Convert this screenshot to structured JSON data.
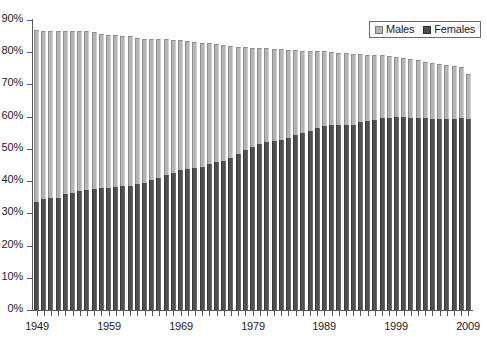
{
  "chart_data": {
    "type": "bar",
    "subtype": "stacked-bar",
    "title": "",
    "subtitle": "",
    "xlabel": "",
    "ylabel": "",
    "ylim": [
      0,
      90
    ],
    "ytick_labels": [
      "0%",
      "10%",
      "20%",
      "30%",
      "40%",
      "50%",
      "60%",
      "70%",
      "80%",
      "90%"
    ],
    "ytick_values": [
      0,
      10,
      20,
      30,
      40,
      50,
      60,
      70,
      80,
      90
    ],
    "xtick_labels": [
      "1949",
      "1959",
      "1969",
      "1979",
      "1989",
      "1999",
      "2009"
    ],
    "xtick_values": [
      1949,
      1959,
      1969,
      1979,
      1989,
      1999,
      2009
    ],
    "grid": false,
    "legend_position": "top-right",
    "legend": [
      "Males",
      "Females"
    ],
    "categories": [
      1949,
      1950,
      1951,
      1952,
      1953,
      1954,
      1955,
      1956,
      1957,
      1958,
      1959,
      1960,
      1961,
      1962,
      1963,
      1964,
      1965,
      1966,
      1967,
      1968,
      1969,
      1970,
      1971,
      1972,
      1973,
      1974,
      1975,
      1976,
      1977,
      1978,
      1979,
      1980,
      1981,
      1982,
      1983,
      1984,
      1985,
      1986,
      1987,
      1988,
      1989,
      1990,
      1991,
      1992,
      1993,
      1994,
      1995,
      1996,
      1997,
      1998,
      1999,
      2000,
      2001,
      2002,
      2003,
      2004,
      2005,
      2006,
      2007,
      2008,
      2009
    ],
    "series": [
      {
        "name": "Females",
        "color": "#4f4f51",
        "values": [
          33.4,
          34.5,
          34.8,
          34.7,
          36.0,
          36.4,
          36.9,
          37.3,
          37.5,
          37.8,
          38.0,
          38.3,
          38.5,
          38.6,
          39.0,
          39.4,
          40.3,
          41.1,
          41.9,
          42.6,
          43.5,
          43.9,
          44.0,
          44.4,
          45.3,
          46.0,
          46.4,
          47.3,
          48.3,
          49.8,
          50.7,
          51.4,
          52.0,
          52.3,
          52.7,
          53.3,
          54.2,
          54.8,
          55.6,
          56.4,
          57.2,
          57.4,
          57.3,
          57.5,
          57.5,
          58.4,
          58.8,
          59.1,
          59.5,
          59.5,
          59.8,
          59.9,
          59.7,
          59.6,
          59.5,
          59.2,
          59.3,
          59.4,
          59.3,
          59.5,
          59.2
        ]
      },
      {
        "name": "Males",
        "color": "#b5b5b5",
        "values": [
          53.5,
          52.2,
          51.8,
          52.0,
          50.7,
          50.2,
          49.7,
          49.3,
          48.9,
          48.0,
          47.5,
          47.1,
          46.6,
          46.3,
          45.5,
          44.8,
          43.7,
          42.9,
          42.1,
          41.3,
          40.2,
          39.6,
          39.2,
          38.5,
          37.6,
          36.6,
          35.7,
          34.6,
          33.4,
          31.9,
          30.7,
          29.9,
          29.3,
          28.8,
          28.2,
          27.4,
          26.4,
          25.7,
          24.9,
          24.0,
          23.1,
          22.8,
          22.6,
          22.2,
          21.9,
          21.0,
          20.5,
          20.0,
          19.5,
          19.2,
          18.7,
          18.4,
          18.3,
          18.0,
          17.6,
          17.4,
          17.0,
          16.6,
          16.3,
          15.8,
          14.0
        ]
      }
    ],
    "totals": [
      86.9,
      86.7,
      86.6,
      86.7,
      86.7,
      86.6,
      86.6,
      86.6,
      86.4,
      85.8,
      85.5,
      85.4,
      85.1,
      84.9,
      84.5,
      84.2,
      84.0,
      84.0,
      84.0,
      83.9,
      83.7,
      83.5,
      83.2,
      82.9,
      82.9,
      82.6,
      82.1,
      81.9,
      81.7,
      81.7,
      81.4,
      81.3,
      81.3,
      81.1,
      80.9,
      80.7,
      80.6,
      80.5,
      80.5,
      80.4,
      80.3,
      80.2,
      79.9,
      79.7,
      79.4,
      79.4,
      79.3,
      79.1,
      79.0,
      78.7,
      78.5,
      78.3,
      78.0,
      77.6,
      77.1,
      76.6,
      76.3,
      76.0,
      75.6,
      75.3,
      73.2
    ]
  },
  "legend": {
    "males_label": "Males",
    "females_label": "Females"
  },
  "colors": {
    "males": "#b5b5b5",
    "females": "#4f4f51",
    "axis": "#59595c",
    "text": "#1c1c1c",
    "background": "#ffffff"
  }
}
